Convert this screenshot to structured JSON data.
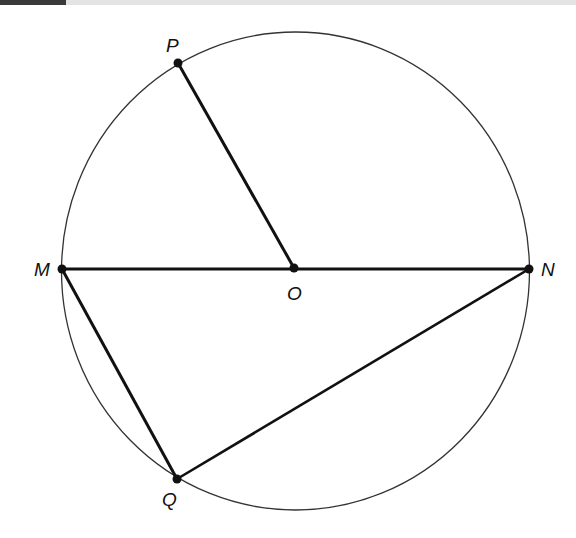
{
  "figure": {
    "colors": {
      "stroke": "#111111",
      "circle": "#333333",
      "header_dark": "#3a3a3a",
      "header_light": "#e4e4e4"
    },
    "circle": {
      "cx": 295.5,
      "cy": 271,
      "rx": 234,
      "ry": 239
    },
    "points": [
      {
        "name": "P",
        "x": 178,
        "y": 63
      },
      {
        "name": "M",
        "x": 62,
        "y": 269
      },
      {
        "name": "O",
        "x": 294,
        "y": 268
      },
      {
        "name": "N",
        "x": 529,
        "y": 269
      },
      {
        "name": "Q",
        "x": 177,
        "y": 479
      }
    ],
    "segments": [
      {
        "from": "P",
        "to": "O"
      },
      {
        "from": "M",
        "to": "N"
      },
      {
        "from": "M",
        "to": "Q"
      },
      {
        "from": "Q",
        "to": "N"
      }
    ],
    "labels": {
      "P": "P",
      "M": "M",
      "O": "O",
      "N": "N",
      "Q": "Q"
    }
  }
}
